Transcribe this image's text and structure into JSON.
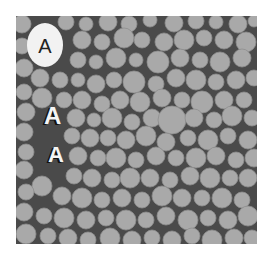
{
  "figure": {
    "background_color": "#ffffff",
    "panel": {
      "x": 16,
      "y": 16,
      "width": 241,
      "height": 228,
      "matrix_color": "#4a4a4a"
    },
    "particle_color": "#a9a9a9",
    "particle_edge_color": "#8e8e8e",
    "labels": [
      {
        "text": "A",
        "x": 29,
        "y": 37,
        "size": 20,
        "style": "ellipse",
        "ellipse": {
          "cx": 29,
          "cy": 29,
          "rx": 18,
          "ry": 22
        }
      },
      {
        "text": "A",
        "x": 28,
        "y": 108,
        "size": 24,
        "style": "shadow"
      },
      {
        "text": "A",
        "x": 32,
        "y": 146,
        "size": 22,
        "style": "shadow"
      }
    ],
    "particles": [
      [
        6,
        8,
        9
      ],
      [
        50,
        6,
        8
      ],
      [
        70,
        8,
        7
      ],
      [
        92,
        6,
        9
      ],
      [
        113,
        8,
        8
      ],
      [
        134,
        4,
        7
      ],
      [
        158,
        7,
        9
      ],
      [
        180,
        5,
        8
      ],
      [
        200,
        6,
        7
      ],
      [
        222,
        8,
        9
      ],
      [
        238,
        5,
        6
      ],
      [
        66,
        24,
        9
      ],
      [
        86,
        26,
        8
      ],
      [
        108,
        22,
        10
      ],
      [
        126,
        24,
        8
      ],
      [
        148,
        26,
        9
      ],
      [
        168,
        24,
        10
      ],
      [
        188,
        22,
        8
      ],
      [
        208,
        24,
        9
      ],
      [
        230,
        26,
        10
      ],
      [
        6,
        30,
        8
      ],
      [
        62,
        44,
        8
      ],
      [
        80,
        46,
        7
      ],
      [
        100,
        42,
        10
      ],
      [
        120,
        44,
        7
      ],
      [
        142,
        46,
        11
      ],
      [
        164,
        42,
        9
      ],
      [
        184,
        44,
        8
      ],
      [
        204,
        46,
        10
      ],
      [
        226,
        42,
        9
      ],
      [
        8,
        52,
        9
      ],
      [
        24,
        62,
        9
      ],
      [
        44,
        64,
        8
      ],
      [
        62,
        64,
        7
      ],
      [
        80,
        68,
        9
      ],
      [
        98,
        64,
        8
      ],
      [
        118,
        66,
        11
      ],
      [
        140,
        68,
        8
      ],
      [
        160,
        62,
        9
      ],
      [
        180,
        64,
        10
      ],
      [
        200,
        66,
        8
      ],
      [
        220,
        64,
        9
      ],
      [
        238,
        62,
        8
      ],
      [
        8,
        76,
        8
      ],
      [
        26,
        82,
        10
      ],
      [
        48,
        84,
        8
      ],
      [
        66,
        84,
        9
      ],
      [
        86,
        88,
        8
      ],
      [
        104,
        84,
        9
      ],
      [
        124,
        86,
        10
      ],
      [
        146,
        82,
        9
      ],
      [
        166,
        84,
        8
      ],
      [
        186,
        86,
        11
      ],
      [
        208,
        84,
        9
      ],
      [
        228,
        84,
        8
      ],
      [
        10,
        96,
        9
      ],
      [
        60,
        102,
        9
      ],
      [
        78,
        104,
        7
      ],
      [
        96,
        102,
        10
      ],
      [
        116,
        106,
        8
      ],
      [
        136,
        102,
        9
      ],
      [
        156,
        104,
        14
      ],
      [
        178,
        102,
        9
      ],
      [
        198,
        104,
        8
      ],
      [
        216,
        100,
        10
      ],
      [
        236,
        102,
        8
      ],
      [
        8,
        116,
        9
      ],
      [
        56,
        120,
        8
      ],
      [
        74,
        122,
        9
      ],
      [
        92,
        122,
        8
      ],
      [
        110,
        124,
        9
      ],
      [
        130,
        120,
        10
      ],
      [
        150,
        126,
        9
      ],
      [
        172,
        122,
        8
      ],
      [
        192,
        124,
        10
      ],
      [
        212,
        120,
        8
      ],
      [
        232,
        124,
        9
      ],
      [
        10,
        136,
        8
      ],
      [
        62,
        140,
        9
      ],
      [
        82,
        142,
        8
      ],
      [
        100,
        142,
        10
      ],
      [
        120,
        144,
        8
      ],
      [
        140,
        140,
        9
      ],
      [
        160,
        142,
        8
      ],
      [
        180,
        142,
        10
      ],
      [
        200,
        140,
        9
      ],
      [
        220,
        144,
        8
      ],
      [
        238,
        142,
        9
      ],
      [
        8,
        154,
        9
      ],
      [
        26,
        170,
        10
      ],
      [
        58,
        160,
        8
      ],
      [
        76,
        162,
        9
      ],
      [
        96,
        164,
        8
      ],
      [
        114,
        162,
        10
      ],
      [
        134,
        162,
        9
      ],
      [
        154,
        164,
        8
      ],
      [
        174,
        160,
        9
      ],
      [
        194,
        162,
        10
      ],
      [
        214,
        162,
        8
      ],
      [
        232,
        162,
        9
      ],
      [
        10,
        176,
        8
      ],
      [
        46,
        180,
        9
      ],
      [
        66,
        182,
        10
      ],
      [
        86,
        184,
        8
      ],
      [
        106,
        182,
        9
      ],
      [
        126,
        184,
        8
      ],
      [
        146,
        180,
        10
      ],
      [
        166,
        182,
        9
      ],
      [
        186,
        182,
        8
      ],
      [
        206,
        182,
        10
      ],
      [
        226,
        184,
        8
      ],
      [
        8,
        196,
        9
      ],
      [
        28,
        200,
        8
      ],
      [
        48,
        202,
        10
      ],
      [
        70,
        204,
        9
      ],
      [
        90,
        202,
        8
      ],
      [
        110,
        204,
        10
      ],
      [
        130,
        204,
        8
      ],
      [
        150,
        200,
        9
      ],
      [
        172,
        204,
        10
      ],
      [
        192,
        202,
        8
      ],
      [
        212,
        204,
        9
      ],
      [
        232,
        200,
        10
      ],
      [
        10,
        218,
        10
      ],
      [
        32,
        220,
        8
      ],
      [
        52,
        222,
        9
      ],
      [
        72,
        224,
        8
      ],
      [
        94,
        222,
        10
      ],
      [
        116,
        224,
        9
      ],
      [
        136,
        222,
        8
      ],
      [
        156,
        224,
        9
      ],
      [
        176,
        220,
        8
      ],
      [
        196,
        224,
        10
      ],
      [
        218,
        222,
        9
      ],
      [
        236,
        222,
        8
      ]
    ]
  }
}
